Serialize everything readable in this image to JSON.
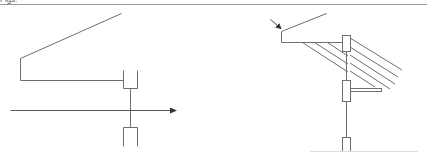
{
  "header": {
    "text": "Figs:"
  },
  "colors": {
    "stroke": "#6f6f6f",
    "rule": "#9a9a9a",
    "background": "#ffffff"
  },
  "figures": [
    {
      "id": "left-figure",
      "description": "Inclined member attached to a cup-shaped joint on a vertical stem crossing a horizontal directional arrow, with a second cup below",
      "elements": [
        "inclined-line",
        "bracket-frame",
        "upper-cup",
        "vertical-stem",
        "horizontal-arrow",
        "lower-cup"
      ]
    },
    {
      "id": "right-figure",
      "description": "Inclined member with pointer arrow, hatched underside, vertical post with upper cap, side block with horizontal arm, and bottom block on a base line",
      "elements": [
        "pointer-arrow",
        "inclined-line",
        "bracket-frame",
        "hatch-lines",
        "upper-cap",
        "vertical-stem",
        "side-block",
        "side-arm",
        "bottom-block",
        "base-line"
      ]
    }
  ]
}
